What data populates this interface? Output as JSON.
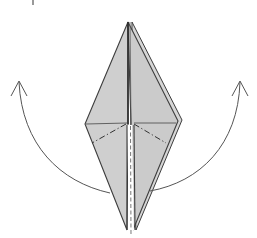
{
  "diagram": {
    "type": "origami-fold-step",
    "colors": {
      "paper_fill": "#cfcfcf",
      "paper_fill_light": "#dadada",
      "stroke": "#3d3d3d",
      "arrow": "#555555",
      "background": "#ffffff"
    },
    "model": {
      "top_point": [
        128,
        22
      ],
      "top_point_back_layer": [
        132,
        22
      ],
      "left_vertex": [
        85,
        124
      ],
      "right_vertex": [
        180,
        121
      ],
      "bottom_left_point": [
        127,
        230
      ],
      "bottom_right_point": [
        135,
        230
      ],
      "center": [
        128,
        123
      ]
    },
    "crease_lines": [
      {
        "kind": "existing-crease",
        "from": [
          85,
          124
        ],
        "to": [
          128,
          123
        ]
      },
      {
        "kind": "existing-crease",
        "from": [
          133,
          123
        ],
        "to": [
          176,
          123
        ]
      },
      {
        "kind": "mountain-fold",
        "from": [
          126,
          124
        ],
        "to": [
          92,
          143
        ]
      },
      {
        "kind": "mountain-fold",
        "from": [
          134,
          124
        ],
        "to": [
          166,
          143
        ]
      },
      {
        "kind": "hidden-edge",
        "from": [
          130,
          125
        ],
        "to": [
          130,
          228
        ]
      }
    ],
    "arrows": [
      {
        "name": "lift-left-flap",
        "from": [
          110,
          193
        ],
        "to": [
          19,
          82
        ],
        "direction": "up-left"
      },
      {
        "name": "lift-right-flap",
        "from": [
          150,
          191
        ],
        "to": [
          240,
          82
        ],
        "direction": "up-right"
      }
    ]
  }
}
